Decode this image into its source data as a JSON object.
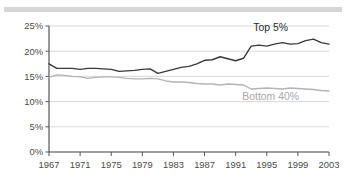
{
  "figure": {
    "background_color": "#ffffff",
    "top_rule_color": "#d6d6d8"
  },
  "chart_data": {
    "type": "line",
    "title": "",
    "subtitle": "",
    "xlabel": "",
    "ylabel": "",
    "xlim": [
      1967,
      2003
    ],
    "ylim": [
      0,
      25
    ],
    "grid": true,
    "grid_axis": "y",
    "legend_position": "inline-annotation",
    "y_tick_labels": [
      "0%",
      "5%",
      "10%",
      "15%",
      "20%",
      "25%"
    ],
    "y_tick_values": [
      0,
      5,
      10,
      15,
      20,
      25
    ],
    "x_tick_labels": [
      "1967",
      "1971",
      "1975",
      "1979",
      "1983",
      "1987",
      "1991",
      "1995",
      "1999",
      "2003"
    ],
    "x_tick_values": [
      1967,
      1971,
      1975,
      1979,
      1983,
      1987,
      1991,
      1995,
      1999,
      2003
    ],
    "x": [
      1967,
      1968,
      1969,
      1970,
      1971,
      1972,
      1973,
      1974,
      1975,
      1976,
      1977,
      1978,
      1979,
      1980,
      1981,
      1982,
      1983,
      1984,
      1985,
      1986,
      1987,
      1988,
      1989,
      1990,
      1991,
      1992,
      1993,
      1994,
      1995,
      1996,
      1997,
      1998,
      1999,
      2000,
      2001,
      2002,
      2003
    ],
    "series": [
      {
        "name": "Top 5%",
        "label": "Top 5%",
        "color": "#3a3a3a",
        "line_width": 1.4,
        "values": [
          17.5,
          16.6,
          16.6,
          16.6,
          16.4,
          16.6,
          16.6,
          16.5,
          16.4,
          16.0,
          16.1,
          16.2,
          16.4,
          16.5,
          15.6,
          16.0,
          16.4,
          16.8,
          17.0,
          17.5,
          18.2,
          18.3,
          18.9,
          18.5,
          18.1,
          18.6,
          21.0,
          21.2,
          21.0,
          21.4,
          21.7,
          21.4,
          21.5,
          22.1,
          22.4,
          21.7,
          21.4
        ]
      },
      {
        "name": "Bottom 40%",
        "label": "Bottom 40%",
        "color": "#b4b4b4",
        "line_width": 1.4,
        "values": [
          14.8,
          15.3,
          15.2,
          15.0,
          14.9,
          14.6,
          14.8,
          14.9,
          14.9,
          14.8,
          14.6,
          14.5,
          14.5,
          14.6,
          14.5,
          14.1,
          13.9,
          13.9,
          13.8,
          13.6,
          13.5,
          13.5,
          13.3,
          13.5,
          13.4,
          13.3,
          12.5,
          12.6,
          12.7,
          12.6,
          12.5,
          12.7,
          12.6,
          12.5,
          12.4,
          12.2,
          12.1
        ]
      }
    ],
    "annotations": [
      {
        "text": "Top 5%",
        "series": "Top 5%",
        "x": 1995.5,
        "y": 24.0
      },
      {
        "text": "Bottom 40%",
        "series": "Bottom 40%",
        "x": 1995.5,
        "y": 10.4
      }
    ],
    "axis": {
      "line_color": "#555555",
      "grid_color": "#d9d9d9",
      "tick_label_color": "#4b4b4b"
    }
  }
}
